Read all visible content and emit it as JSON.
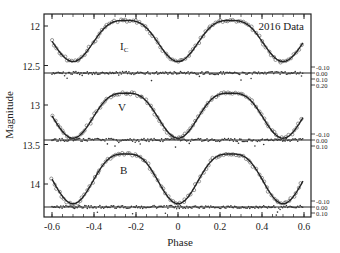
{
  "chart_data": {
    "type": "scatter",
    "title": "",
    "annotation": "2016 Data",
    "xlabel": "Phase",
    "ylabel": "Magnitude",
    "xlim": [
      -0.63,
      0.65
    ],
    "x_ticks": [
      -0.6,
      -0.4,
      -0.2,
      0,
      0.2,
      0.4,
      0.6
    ],
    "x_tick_labels": [
      "-0.6",
      "-0.4",
      "-0.2",
      "0",
      "0.2",
      "0.4",
      "0.6"
    ],
    "y_inverted": true,
    "y_ticks": [
      12,
      12.5,
      13,
      13.5,
      14
    ],
    "y_tick_labels": [
      "12",
      "12.5",
      "13",
      "13.5",
      "14"
    ],
    "grid": false,
    "panels": [
      {
        "band": "Ic",
        "label_main": "I",
        "label_sub": "C",
        "mag_max_brightness": 11.93,
        "mag_primary_min": 12.45,
        "mag_secondary_min": 12.45,
        "residual_ticks": [
          "-0.10",
          "0.00",
          "0.10",
          "0.20"
        ]
      },
      {
        "band": "V",
        "label_main": "V",
        "label_sub": "",
        "mag_max_brightness": 12.85,
        "mag_primary_min": 13.42,
        "mag_secondary_min": 13.42,
        "residual_ticks": [
          "-0.10",
          "0.00",
          "0.10"
        ]
      },
      {
        "band": "B",
        "label_main": "B",
        "label_sub": "",
        "mag_max_brightness": 13.62,
        "mag_primary_min": 14.25,
        "mag_secondary_min": 14.25,
        "residual_ticks": [
          "-0.10",
          "0.00",
          "0.10"
        ]
      }
    ],
    "series": [
      {
        "name": "Observed",
        "marker": "open-circle"
      },
      {
        "name": "Model fit",
        "marker": "line"
      },
      {
        "name": "Residuals",
        "marker": "dot"
      }
    ]
  },
  "colors": {
    "axis": "#222222",
    "points": "#555555",
    "fit": "#222222"
  }
}
